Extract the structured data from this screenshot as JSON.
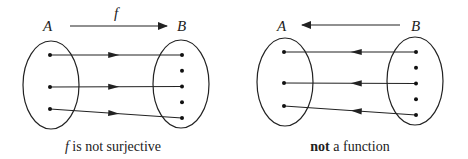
{
  "diagrams": [
    {
      "id": "not-surjective",
      "domain_label": "A",
      "codomain_label": "B",
      "map_label": "f",
      "direction": "A-to-B",
      "domain_points": 3,
      "codomain_points": 5,
      "mappings": [
        [
          0,
          0
        ],
        [
          1,
          2
        ],
        [
          2,
          4
        ]
      ],
      "caption_symbol": "f",
      "caption_text": " is not surjective"
    },
    {
      "id": "not-a-function",
      "domain_label": "A",
      "codomain_label": "B",
      "direction": "B-to-A",
      "domain_points": 3,
      "codomain_points": 5,
      "mappings": [
        [
          0,
          0
        ],
        [
          1,
          2
        ],
        [
          2,
          4
        ]
      ],
      "caption_bold": "not",
      "caption_text": " a function"
    }
  ]
}
